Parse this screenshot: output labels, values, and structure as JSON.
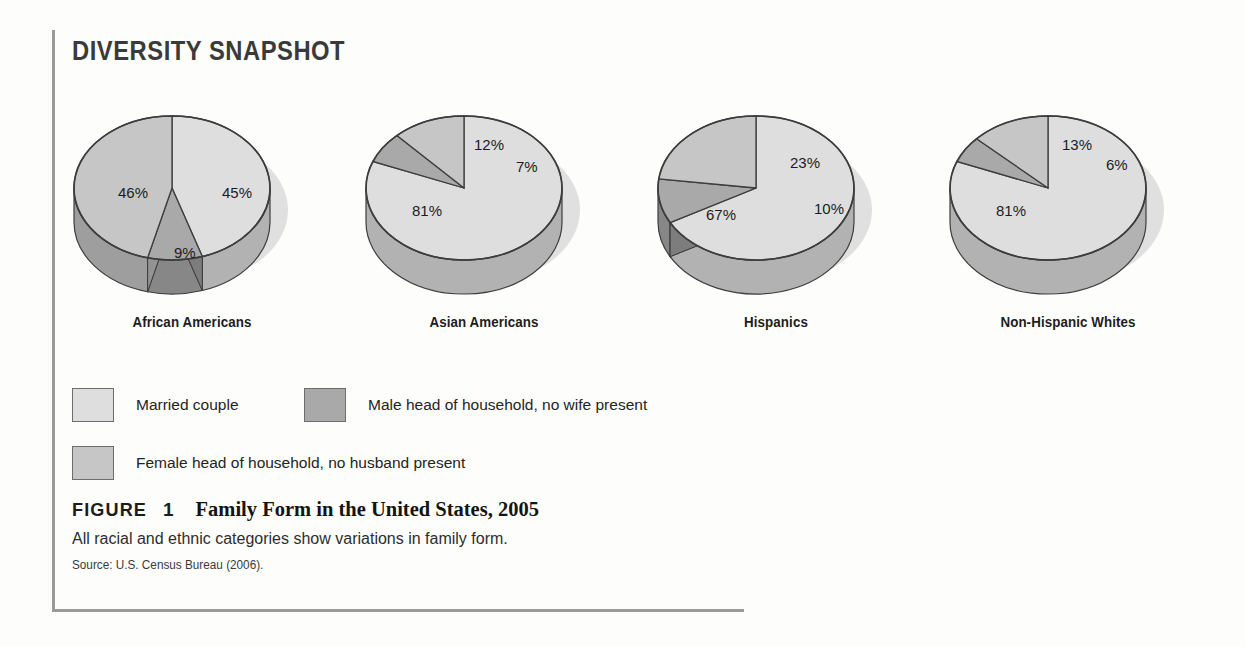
{
  "header": {
    "snapshot_label": "DIVERSITY SNAPSHOT"
  },
  "legend": {
    "items": [
      {
        "label": "Married couple",
        "color": "#dedede",
        "key": "married"
      },
      {
        "label": "Male head of household, no wife present",
        "color": "#a9a9a9",
        "key": "male_head"
      },
      {
        "label": "Female head of household, no husband present",
        "color": "#c6c6c6",
        "key": "female_head"
      }
    ]
  },
  "caption": {
    "figure_word": "FIGURE",
    "figure_number": "1",
    "title": "Family Form in the United States, 2005",
    "subtitle": "All racial and ethnic categories show variations in family form.",
    "source": "Source: U.S. Census Bureau (2006)."
  },
  "chart_data": {
    "type": "pie",
    "title": "Family Form in the United States, 2005",
    "subtitle": "All racial and ethnic categories show variations in family form.",
    "source": "Source: U.S. Census Bureau (2006).",
    "units": "percent",
    "legend_position": "bottom-left",
    "series_names": [
      "Married couple",
      "Male head of household, no wife present",
      "Female head of household, no husband present"
    ],
    "series_colors": [
      "#dedede",
      "#a9a9a9",
      "#c6c6c6"
    ],
    "groups": [
      {
        "name": "African Americans",
        "slices": [
          {
            "series": "Married couple",
            "value": 45,
            "label": "45%"
          },
          {
            "series": "Male head of household, no wife present",
            "value": 9,
            "label": "9%"
          },
          {
            "series": "Female head of household, no husband present",
            "value": 46,
            "label": "46%"
          }
        ]
      },
      {
        "name": "Asian Americans",
        "slices": [
          {
            "series": "Married couple",
            "value": 81,
            "label": "81%"
          },
          {
            "series": "Male head of household, no wife present",
            "value": 7,
            "label": "7%"
          },
          {
            "series": "Female head of household, no husband present",
            "value": 12,
            "label": "12%"
          }
        ]
      },
      {
        "name": "Hispanics",
        "slices": [
          {
            "series": "Married couple",
            "value": 67,
            "label": "67%"
          },
          {
            "series": "Male head of household, no wife present",
            "value": 10,
            "label": "10%"
          },
          {
            "series": "Female head of household, no husband present",
            "value": 23,
            "label": "23%"
          }
        ]
      },
      {
        "name": "Non-Hispanic Whites",
        "slices": [
          {
            "series": "Married couple",
            "value": 81,
            "label": "81%"
          },
          {
            "series": "Male head of household, no wife present",
            "value": 6,
            "label": "6%"
          },
          {
            "series": "Female head of household, no husband present",
            "value": 13,
            "label": "13%"
          }
        ]
      }
    ]
  },
  "pies": [
    {
      "name": "African Americans",
      "x": 0,
      "values": [
        {
          "label": "45%",
          "pct": 45,
          "color": "#dedede",
          "lx": 160,
          "ly": 88
        },
        {
          "label": "9%",
          "pct": 9,
          "color": "#a9a9a9",
          "lx": 112,
          "ly": 148
        },
        {
          "label": "46%",
          "pct": 46,
          "color": "#c6c6c6",
          "lx": 56,
          "ly": 88
        }
      ]
    },
    {
      "name": "Asian Americans",
      "x": 292,
      "values": [
        {
          "label": "81%",
          "pct": 81,
          "color": "#dedede",
          "lx": 58,
          "ly": 106
        },
        {
          "label": "7%",
          "pct": 7,
          "color": "#a9a9a9",
          "lx": 162,
          "ly": 62
        },
        {
          "label": "12%",
          "pct": 12,
          "color": "#c6c6c6",
          "lx": 120,
          "ly": 40
        }
      ]
    },
    {
      "name": "Hispanics",
      "x": 584,
      "values": [
        {
          "label": "67%",
          "pct": 67,
          "color": "#dedede",
          "lx": 60,
          "ly": 110
        },
        {
          "label": "10%",
          "pct": 10,
          "color": "#a9a9a9",
          "lx": 168,
          "ly": 104
        },
        {
          "label": "23%",
          "pct": 23,
          "color": "#c6c6c6",
          "lx": 144,
          "ly": 58
        }
      ]
    },
    {
      "name": "Non-Hispanic Whites",
      "x": 876,
      "values": [
        {
          "label": "81%",
          "pct": 81,
          "color": "#dedede",
          "lx": 58,
          "ly": 106
        },
        {
          "label": "6%",
          "pct": 6,
          "color": "#a9a9a9",
          "lx": 168,
          "ly": 60
        },
        {
          "label": "13%",
          "pct": 13,
          "color": "#c6c6c6",
          "lx": 124,
          "ly": 40
        }
      ]
    }
  ]
}
